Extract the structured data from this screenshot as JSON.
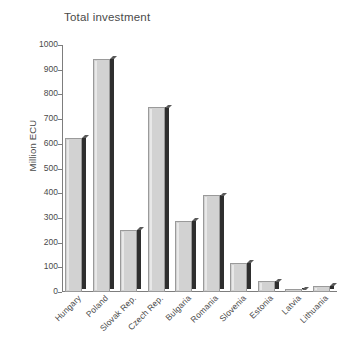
{
  "chart_data": {
    "type": "bar",
    "title": "Total investment",
    "xlabel": "",
    "ylabel": "Million ECU",
    "ylim": [
      0,
      1000
    ],
    "yticks": [
      0,
      100,
      200,
      300,
      400,
      500,
      600,
      700,
      800,
      900,
      1000
    ],
    "grid": false,
    "legend": null,
    "categories": [
      "Hungary",
      "Poland",
      "Slovak Rep.",
      "Czech Rep.",
      "Bulgaria",
      "Romania",
      "Slovenia",
      "Estonia",
      "Latvia",
      "Lithuania"
    ],
    "values": [
      625,
      945,
      253,
      748,
      288,
      392,
      118,
      44,
      8,
      25
    ],
    "bar_face_color": "#d2d2d2",
    "bar_shadow_color": "#2e2e2e",
    "axis_color": "#7d7d7d",
    "text_color": "#4a4a4a",
    "background_color": "#ffffff"
  }
}
